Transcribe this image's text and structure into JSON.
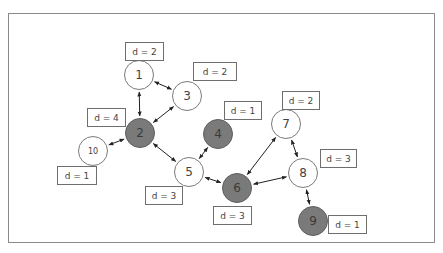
{
  "diagram": {
    "type": "undirected graph with degree labels",
    "nodes": [
      {
        "id": "1",
        "x": 139,
        "y": 75,
        "fill": "white",
        "degree_label": "d = 2",
        "box": {
          "x": 125,
          "y": 42,
          "w": 39
        }
      },
      {
        "id": "2",
        "x": 140,
        "y": 133,
        "fill": "gray",
        "degree_label": "d = 4",
        "box": {
          "x": 87,
          "y": 108,
          "w": 39
        }
      },
      {
        "id": "3",
        "x": 187,
        "y": 96,
        "fill": "white",
        "degree_label": "d = 2",
        "box": {
          "x": 193,
          "y": 62,
          "w": 44
        }
      },
      {
        "id": "4",
        "x": 218,
        "y": 134,
        "fill": "gray",
        "degree_label": "d = 1",
        "box": {
          "x": 224,
          "y": 101,
          "w": 38
        }
      },
      {
        "id": "5",
        "x": 189,
        "y": 172,
        "fill": "white",
        "degree_label": "d = 3",
        "box": {
          "x": 145,
          "y": 186,
          "w": 38
        }
      },
      {
        "id": "6",
        "x": 237,
        "y": 188,
        "fill": "gray",
        "degree_label": "d = 3",
        "box": {
          "x": 213,
          "y": 206,
          "w": 39
        }
      },
      {
        "id": "7",
        "x": 286,
        "y": 124,
        "fill": "white",
        "degree_label": "d = 2",
        "box": {
          "x": 282,
          "y": 91,
          "w": 38
        }
      },
      {
        "id": "8",
        "x": 303,
        "y": 173,
        "fill": "white",
        "degree_label": "d = 3",
        "box": {
          "x": 320,
          "y": 149,
          "w": 37
        }
      },
      {
        "id": "9",
        "x": 313,
        "y": 221,
        "fill": "gray",
        "degree_label": "d = 1",
        "box": {
          "x": 328,
          "y": 215,
          "w": 39
        }
      },
      {
        "id": "10",
        "x": 93,
        "y": 151,
        "fill": "white",
        "degree_label": "d = 1",
        "box": {
          "x": 57,
          "y": 166,
          "w": 40
        }
      }
    ],
    "edges": [
      [
        "1",
        "2"
      ],
      [
        "1",
        "3"
      ],
      [
        "3",
        "2"
      ],
      [
        "2",
        "10"
      ],
      [
        "2",
        "5"
      ],
      [
        "5",
        "4"
      ],
      [
        "5",
        "6"
      ],
      [
        "6",
        "7"
      ],
      [
        "6",
        "8"
      ],
      [
        "7",
        "8"
      ],
      [
        "8",
        "9"
      ]
    ],
    "colors": {
      "white_node": "#ffffff",
      "gray_node": "#7a7a7a",
      "stroke": "#7a7a7a",
      "edge": "#222222"
    }
  }
}
